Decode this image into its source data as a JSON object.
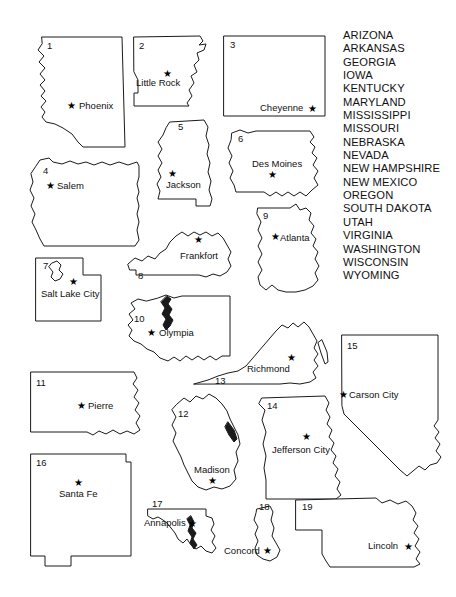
{
  "page": {
    "width": 456,
    "height": 597,
    "background_color": "#ffffff",
    "ink_color": "#1a1a1a"
  },
  "state_name_list": {
    "name": "state-name-bank",
    "items": [
      "ARIZONA",
      "ARKANSAS",
      "GEORGIA",
      "IOWA",
      "KENTUCKY",
      "MARYLAND",
      "MISSISSIPPI",
      "MISSOURI",
      "NEBRASKA",
      "NEVADA",
      "NEW HAMPSHIRE",
      "NEW MEXICO",
      "OREGON",
      "SOUTH DAKOTA",
      "UTAH",
      "VIRGINIA",
      "WASHINGTON",
      "WISCONSIN",
      "WYOMING"
    ]
  },
  "map": {
    "states": [
      {
        "number": "1",
        "state": "ARIZONA",
        "capital": "Phoenix",
        "number_pos": [
          47,
          45
        ],
        "star_pos": [
          72,
          105
        ],
        "label_pos": [
          79,
          108
        ],
        "label_anchor": "start"
      },
      {
        "number": "2",
        "state": "ARKANSAS",
        "capital": "Little Rock",
        "number_pos": [
          139,
          45
        ],
        "star_pos": [
          167,
          73
        ],
        "label_pos": [
          136,
          85
        ],
        "label_anchor": "start"
      },
      {
        "number": "3",
        "state": "WYOMING",
        "capital": "Cheyenne",
        "number_pos": [
          230,
          44
        ],
        "star_pos": [
          312,
          109
        ],
        "label_pos": [
          260,
          110
        ],
        "label_anchor": "start"
      },
      {
        "number": "4",
        "state": "OREGON",
        "capital": "Salem",
        "number_pos": [
          43,
          170
        ],
        "star_pos": [
          51,
          185
        ],
        "label_pos": [
          57,
          188
        ],
        "label_anchor": "start"
      },
      {
        "number": "5",
        "state": "MISSISSIPPI",
        "capital": "Jackson",
        "number_pos": [
          178,
          126
        ],
        "star_pos": [
          172,
          173
        ],
        "label_pos": [
          166,
          184
        ],
        "label_anchor": "start"
      },
      {
        "number": "6",
        "state": "IOWA",
        "capital": "Des Moines",
        "number_pos": [
          238,
          138
        ],
        "star_pos": [
          272,
          172
        ],
        "label_pos": [
          252,
          166
        ],
        "label_anchor": "start"
      },
      {
        "number": "7",
        "state": "UTAH",
        "capital": "Salt Lake City",
        "number_pos": [
          43,
          265
        ],
        "star_pos": [
          73,
          281
        ],
        "label_pos": [
          41,
          293
        ],
        "label_anchor": "start"
      },
      {
        "number": "8",
        "state": "KENTUCKY",
        "capital": "Frankfort",
        "number_pos": [
          139,
          275
        ],
        "star_pos": [
          198,
          240
        ],
        "label_pos": [
          180,
          255
        ],
        "label_anchor": "start"
      },
      {
        "number": "9",
        "state": "GEORGIA",
        "capital": "Atlanta",
        "number_pos": [
          263,
          214
        ],
        "star_pos": [
          275,
          236
        ],
        "label_pos": [
          280,
          239
        ],
        "label_anchor": "start"
      },
      {
        "number": "10",
        "state": "WASHINGTON",
        "capital": "Olympia",
        "number_pos": [
          135,
          317
        ],
        "star_pos": [
          152,
          332
        ],
        "label_pos": [
          159,
          335
        ],
        "label_anchor": "start"
      },
      {
        "number": "11",
        "state": "SOUTH DAKOTA",
        "capital": "Pierre",
        "number_pos": [
          36,
          382
        ],
        "star_pos": [
          81,
          405
        ],
        "label_pos": [
          88,
          408
        ],
        "label_anchor": "start"
      },
      {
        "number": "12",
        "state": "WISCONSIN",
        "capital": "Madison",
        "number_pos": [
          178,
          412
        ],
        "star_pos": [
          212,
          479
        ],
        "label_pos": [
          194,
          470
        ],
        "label_anchor": "start"
      },
      {
        "number": "13",
        "state": "VIRGINIA",
        "capital": "Richmond",
        "number_pos": [
          215,
          380
        ],
        "star_pos": [
          291,
          358
        ],
        "label_pos": [
          247,
          368
        ],
        "label_anchor": "start"
      },
      {
        "number": "14",
        "state": "MISSOURI",
        "capital": "Jefferson City",
        "number_pos": [
          267,
          404
        ],
        "star_pos": [
          306,
          437
        ],
        "label_pos": [
          272,
          450
        ],
        "label_anchor": "start"
      },
      {
        "number": "15",
        "state": "NEVADA",
        "capital": "Carson City",
        "number_pos": [
          347,
          345
        ],
        "star_pos": [
          344,
          394
        ],
        "label_pos": [
          349,
          397
        ],
        "label_anchor": "start"
      },
      {
        "number": "16",
        "state": "NEW MEXICO",
        "capital": "Santa Fe",
        "number_pos": [
          36,
          461
        ],
        "star_pos": [
          78,
          482
        ],
        "label_pos": [
          59,
          494
        ],
        "label_anchor": "start"
      },
      {
        "number": "17",
        "state": "MARYLAND",
        "capital": "Annapolis",
        "number_pos": [
          152,
          502
        ],
        "star_pos": [
          192,
          522
        ],
        "label_pos": [
          144,
          524
        ],
        "label_anchor": "start"
      },
      {
        "number": "18",
        "state": "NEW HAMPSHIRE",
        "capital": "Concord",
        "number_pos": [
          259,
          505
        ],
        "star_pos": [
          267,
          549
        ],
        "label_pos": [
          224,
          551
        ],
        "label_anchor": "start"
      },
      {
        "number": "19",
        "state": "NEBRASKA",
        "capital": "Lincoln",
        "number_pos": [
          302,
          505
        ],
        "star_pos": [
          409,
          546
        ],
        "label_pos": [
          370,
          549
        ],
        "label_anchor": "start"
      }
    ]
  }
}
